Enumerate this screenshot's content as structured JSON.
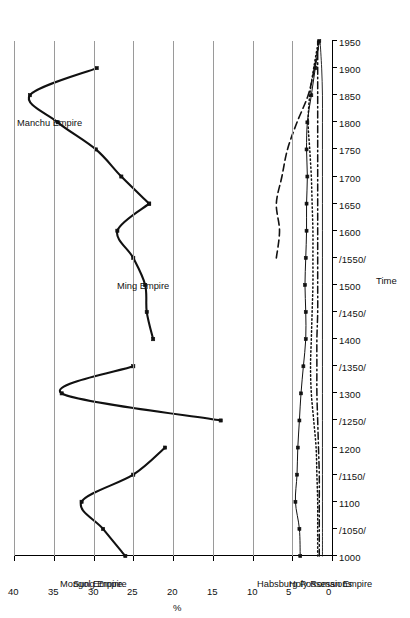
{
  "figure": {
    "background": "#ffffff",
    "orientation": "page rotated 90 degrees (landscape chart on portrait scan)"
  },
  "axes": {
    "x_title": "Time",
    "y_title": "%",
    "y_ticks": [
      "40",
      "35",
      "30",
      "25",
      "20",
      "15",
      "10",
      "5",
      "0"
    ],
    "x_ticks": [
      "1000",
      "/1050/",
      "1100",
      "/1150/",
      "1200",
      "/1250/",
      "1300",
      "/1350/",
      "1400",
      "/1450/",
      "1500",
      "/1550/",
      "1600",
      "1650",
      "1700",
      "1750",
      "1800",
      "1850",
      "1900",
      "1950"
    ]
  },
  "series_labels": {
    "sung": "Sung Empire",
    "mongol": "Mongol Empire",
    "ming": "Ming Empire",
    "manchu": "Manchu Empire",
    "habsburg": "Habsburg Possessions",
    "holy_roman": "Holy Roman Empire"
  },
  "chart_data": {
    "type": "line",
    "title": "",
    "xlabel": "Time",
    "ylabel": "%",
    "ylim": [
      0,
      40
    ],
    "grid": "vertical gridlines every 5 percent",
    "legend": "in-plot text annotations (no legend box)",
    "x": [
      "1000",
      "1050",
      "1100",
      "1150",
      "1200",
      "1250",
      "1300",
      "1350",
      "1400",
      "1450",
      "1500",
      "1550",
      "1600",
      "1650",
      "1700",
      "1750",
      "1800",
      "1850",
      "1900",
      "1950"
    ],
    "series": [
      {
        "name": "Sung Empire",
        "style": "solid thick, square markers",
        "x": [
          "1000",
          "1050",
          "1100",
          "1150",
          "1200"
        ],
        "values": [
          26.0,
          28.8,
          31.5,
          25.0,
          21.0
        ]
      },
      {
        "name": "Mongol Empire",
        "style": "solid thick, square markers",
        "x": [
          "1250",
          "1300",
          "1350"
        ],
        "values": [
          14.0,
          34.0,
          25.0
        ]
      },
      {
        "name": "Ming Empire",
        "style": "solid thick, square markers",
        "x": [
          "1400",
          "1450",
          "1500",
          "1550",
          "1600",
          "1650"
        ],
        "values": [
          22.5,
          23.3,
          23.5,
          25.0,
          27.0,
          23.0
        ]
      },
      {
        "name": "Manchu Empire",
        "style": "solid thick, square markers",
        "x": [
          "1650",
          "1700",
          "1750",
          "1800",
          "1850",
          "1900"
        ],
        "values": [
          23.0,
          26.5,
          29.7,
          34.5,
          38.0,
          29.6
        ]
      },
      {
        "name": "Holy Roman Empire",
        "style": "solid thin, square markers",
        "x": [
          "1000",
          "1050",
          "1100",
          "1150",
          "1200",
          "1250",
          "1300",
          "1350",
          "1400",
          "1450",
          "1500",
          "1550",
          "1600",
          "1650",
          "1700",
          "1750",
          "1800",
          "1850",
          "1900",
          "1950"
        ],
        "values": [
          4.0,
          4.1,
          4.6,
          4.4,
          4.3,
          4.1,
          3.9,
          3.6,
          3.3,
          3.3,
          3.4,
          3.3,
          3.2,
          3.2,
          3.1,
          3.2,
          3.1,
          2.6,
          2.1,
          1.6
        ]
      },
      {
        "name": "Habsburg Possessions",
        "style": "dashed",
        "x": [
          "1550",
          "1600",
          "1650",
          "1700",
          "1750",
          "1800",
          "1850",
          "1900",
          "1950"
        ],
        "values": [
          7.0,
          6.6,
          7.0,
          6.3,
          5.6,
          4.4,
          3.0,
          2.2,
          1.6
        ]
      },
      {
        "name": "unlabelled dotted series",
        "style": "dotted",
        "x": [
          "1000",
          "1050",
          "1100",
          "1150",
          "1200",
          "1250",
          "1300",
          "1350",
          "1400",
          "1450",
          "1500",
          "1550",
          "1600",
          "1650",
          "1700",
          "1750",
          "1800",
          "1850",
          "1900",
          "1950"
        ],
        "values": [
          1.8,
          1.8,
          1.8,
          1.9,
          2.0,
          2.3,
          2.6,
          2.7,
          2.6,
          2.5,
          2.4,
          2.4,
          2.4,
          2.5,
          2.6,
          2.8,
          3.0,
          2.8,
          2.3,
          1.7
        ]
      },
      {
        "name": "unlabelled dash-dot series",
        "style": "dash-dot",
        "x": [
          "1000",
          "1050",
          "1100",
          "1150",
          "1200",
          "1250",
          "1300",
          "1350",
          "1400",
          "1450",
          "1500",
          "1550",
          "1600",
          "1650",
          "1700",
          "1750",
          "1800",
          "1850",
          "1900",
          "1950"
        ],
        "values": [
          1.6,
          1.6,
          1.6,
          1.6,
          1.7,
          1.8,
          1.9,
          1.9,
          1.9,
          1.8,
          1.8,
          1.8,
          1.8,
          1.8,
          1.8,
          1.8,
          1.8,
          1.8,
          1.8,
          1.8
        ]
      },
      {
        "name": "unlabelled thin solid baseline series",
        "style": "thin solid",
        "x": [
          "1000",
          "1050",
          "1100",
          "1150",
          "1200",
          "1250",
          "1300",
          "1350",
          "1400",
          "1450",
          "1500",
          "1550",
          "1600",
          "1650",
          "1700",
          "1750",
          "1800",
          "1850",
          "1900",
          "1950"
        ],
        "values": [
          1.2,
          1.2,
          1.2,
          1.2,
          1.2,
          1.2,
          1.2,
          1.2,
          1.2,
          1.2,
          1.2,
          1.2,
          1.2,
          1.2,
          1.2,
          1.2,
          1.2,
          1.2,
          1.3,
          1.5
        ]
      }
    ]
  }
}
